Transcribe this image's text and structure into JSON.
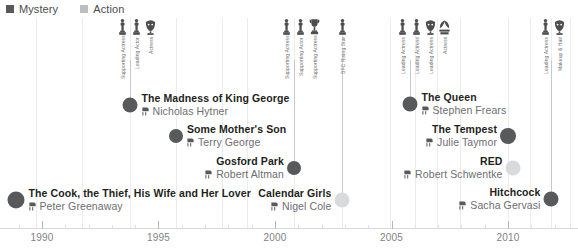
{
  "legend": {
    "items": [
      {
        "label": "Mystery",
        "color": "#58595b",
        "icon": "square-swatch-icon"
      },
      {
        "label": "Action",
        "color": "#bcbec0",
        "icon": "square-swatch-icon"
      }
    ]
  },
  "axis": {
    "label": "Year",
    "ticks": [
      "1990",
      "1995",
      "2000",
      "2005",
      "2010"
    ],
    "range": [
      1988.2,
      2013.0
    ]
  },
  "colors": {
    "mystery": "#58595b",
    "action": "#d9dadb",
    "title": "#231f20",
    "director": "#6d6e71",
    "axis": "#808285",
    "grid": "#ececec",
    "stem": "#c9c9c9"
  },
  "chart_data": {
    "type": "scatter",
    "title": "",
    "xlabel": "",
    "ylabel": "",
    "xlim": [
      1988.2,
      2013.0
    ],
    "grid": true,
    "legend_position": "top-left",
    "categories": [
      "Mystery",
      "Action"
    ],
    "films": [
      {
        "title": "The Cook, the Thief, His Wife and Her Lover",
        "director": "Peter Greenaway",
        "year": 1989,
        "genre": "Mystery",
        "x": 16,
        "y": 200,
        "dot_size": 17,
        "align": "right",
        "director_icon": "director-chair-icon"
      },
      {
        "title": "The Madness of King George",
        "director": "Nicholas Hytner",
        "year": 1994,
        "genre": "Mystery",
        "x": 130,
        "y": 105,
        "dot_size": 15,
        "align": "right",
        "director_icon": "director-chair-icon"
      },
      {
        "title": "Some Mother's Son",
        "director": "Terry George",
        "year": 1996,
        "genre": "Mystery",
        "x": 176,
        "y": 136,
        "dot_size": 14,
        "align": "right",
        "director_icon": "director-chair-icon"
      },
      {
        "title": "Gosford Park",
        "director": "Robert Altman",
        "year": 2001,
        "genre": "Mystery",
        "x": 294,
        "y": 168,
        "dot_size": 14,
        "align": "left",
        "director_icon": "director-chair-icon"
      },
      {
        "title": "Calendar Girls",
        "director": "Nigel Cole",
        "year": 2003,
        "genre": "Action",
        "x": 342,
        "y": 200,
        "dot_size": 15,
        "align": "left",
        "director_icon": "director-chair-icon"
      },
      {
        "title": "The Queen",
        "director": "Stephen Frears",
        "year": 2006,
        "genre": "Mystery",
        "x": 410,
        "y": 104,
        "dot_size": 15,
        "align": "right",
        "director_icon": "director-chair-icon"
      },
      {
        "title": "The Tempest",
        "director": "Julie Taymor",
        "year": 2010,
        "genre": "Mystery",
        "x": 508,
        "y": 136,
        "dot_size": 16,
        "align": "left",
        "director_icon": "director-chair-icon"
      },
      {
        "title": "RED",
        "director": "Robert Schwentke",
        "year": 2010,
        "genre": "Action",
        "x": 513,
        "y": 168,
        "dot_size": 15,
        "align": "left",
        "director_icon": "director-chair-icon"
      },
      {
        "title": "Hitchcock",
        "director": "Sacha Gervasi",
        "year": 2012,
        "genre": "Mystery",
        "x": 551,
        "y": 199,
        "dot_size": 15,
        "align": "left",
        "director_icon": "director-chair-icon"
      }
    ],
    "award_groups": [
      {
        "stem_x": 130,
        "stem_top": 60,
        "stem_bottom": 100,
        "awards": [
          {
            "x": 122,
            "label": "Supporting Actress",
            "icon": "oscar-statuette-icon"
          },
          {
            "x": 136,
            "label": "Leading Actor",
            "icon": "oscar-statuette-icon"
          },
          {
            "x": 150,
            "label": "Actress",
            "icon": "award-mask-icon"
          }
        ]
      },
      {
        "stem_x": 294,
        "stem_top": 60,
        "stem_bottom": 163,
        "awards": [
          {
            "x": 286,
            "label": "Supporting Actress",
            "icon": "oscar-statuette-icon"
          },
          {
            "x": 300,
            "label": "Supporting Actor",
            "icon": "oscar-statuette-icon"
          },
          {
            "x": 314,
            "label": "Supporting Actress",
            "icon": "award-trophy-icon"
          }
        ]
      },
      {
        "stem_x": 342,
        "stem_top": 60,
        "stem_bottom": 195,
        "awards": [
          {
            "x": 342,
            "label": "BFC Rising Star",
            "icon": "oscar-statuette-icon"
          }
        ]
      },
      {
        "stem_x": 410,
        "stem_top": 60,
        "stem_bottom": 99,
        "awards": [
          {
            "x": 402,
            "label": "Leading Actress",
            "icon": "oscar-statuette-icon"
          },
          {
            "x": 416,
            "label": "Leading Actress",
            "icon": "oscar-statuette-icon"
          },
          {
            "x": 430,
            "label": "Leading Actress",
            "icon": "award-mask-icon"
          },
          {
            "x": 444,
            "label": "Actress",
            "icon": "award-laurel-icon"
          }
        ]
      },
      {
        "stem_x": 551,
        "stem_top": 60,
        "stem_bottom": 194,
        "awards": [
          {
            "x": 545,
            "label": "Leading Actress",
            "icon": "oscar-statuette-icon"
          },
          {
            "x": 559,
            "label": "Makeup & Hair",
            "icon": "award-mask-icon"
          }
        ]
      }
    ],
    "gridlines_x": [
      36,
      82,
      130,
      176,
      222,
      247,
      294,
      342,
      390,
      415,
      437,
      460,
      508,
      530,
      551,
      570
    ]
  }
}
